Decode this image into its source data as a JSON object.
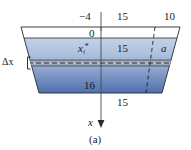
{
  "figure": {
    "caption": "(a)",
    "axis": {
      "vertical_label": "x",
      "arrow": "down",
      "origin_label": "0"
    },
    "labels": {
      "top_left_depth": "−4",
      "top_half_width": "15",
      "top_right_width": "10",
      "slab_point": "x",
      "slab_point_sub": "i",
      "slab_point_sup": "*",
      "mid_half_width": "15",
      "horizontal_distance": "a",
      "slab_thickness": "Δx",
      "bottom_depth": "16",
      "bottom_half_width": "15"
    },
    "colors": {
      "water_light": "#aec2de",
      "water_dark": "#4f6fae",
      "outline": "#2a2a2a",
      "slab_fill": "#9aa9b8",
      "dash": "#1a1a1a",
      "text": "#1a1a1a"
    },
    "geometry": {
      "top_rim_y": 27,
      "water_surface_y": 38,
      "slab_top_y": 60,
      "slab_bottom_y": 66,
      "bottom_y": 93,
      "axis_x": 101
    }
  }
}
